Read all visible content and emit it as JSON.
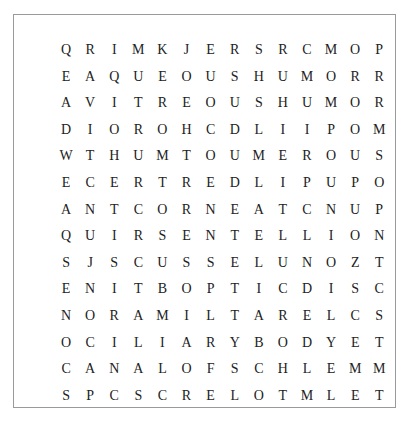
{
  "puzzle": {
    "type": "word-search",
    "rows": 14,
    "cols": 14,
    "grid": [
      [
        "Q",
        "R",
        "I",
        "M",
        "K",
        "J",
        "E",
        "R",
        "S",
        "R",
        "C",
        "M",
        "O",
        "P"
      ],
      [
        "E",
        "A",
        "Q",
        "U",
        "E",
        "O",
        "U",
        "S",
        "H",
        "U",
        "M",
        "O",
        "R",
        "R"
      ],
      [
        "A",
        "V",
        "I",
        "T",
        "R",
        "E",
        "O",
        "U",
        "S",
        "H",
        "U",
        "M",
        "O",
        "R"
      ],
      [
        "D",
        "I",
        "O",
        "R",
        "O",
        "H",
        "C",
        "D",
        "L",
        "I",
        "I",
        "P",
        "O",
        "M"
      ],
      [
        "W",
        "T",
        "H",
        "U",
        "M",
        "T",
        "O",
        "U",
        "M",
        "E",
        "R",
        "O",
        "U",
        "S"
      ],
      [
        "E",
        "C",
        "E",
        "R",
        "T",
        "R",
        "E",
        "D",
        "L",
        "I",
        "P",
        "U",
        "P",
        "O"
      ],
      [
        "A",
        "N",
        "T",
        "C",
        "O",
        "R",
        "N",
        "E",
        "A",
        "T",
        "C",
        "N",
        "U",
        "P"
      ],
      [
        "Q",
        "U",
        "I",
        "R",
        "S",
        "E",
        "N",
        "T",
        "E",
        "L",
        "L",
        "I",
        "O",
        "N"
      ],
      [
        "S",
        "J",
        "S",
        "C",
        "U",
        "S",
        "S",
        "E",
        "L",
        "U",
        "N",
        "O",
        "Z",
        "T"
      ],
      [
        "E",
        "N",
        "I",
        "T",
        "B",
        "O",
        "P",
        "T",
        "I",
        "C",
        "D",
        "I",
        "S",
        "C"
      ],
      [
        "N",
        "O",
        "R",
        "A",
        "M",
        "I",
        "L",
        "T",
        "A",
        "R",
        "E",
        "L",
        "C",
        "S"
      ],
      [
        "O",
        "C",
        "I",
        "L",
        "I",
        "A",
        "R",
        "Y",
        "B",
        "O",
        "D",
        "Y",
        "E",
        "T"
      ],
      [
        "C",
        "A",
        "N",
        "A",
        "L",
        "O",
        "F",
        "S",
        "C",
        "H",
        "L",
        "E",
        "M",
        "M"
      ],
      [
        "S",
        "P",
        "C",
        "S",
        "C",
        "R",
        "E",
        "L",
        "O",
        "T",
        "M",
        "L",
        "E",
        "T"
      ]
    ],
    "colors": {
      "letter": "#222222",
      "border": "#9a9a9a",
      "background": "#ffffff"
    }
  }
}
